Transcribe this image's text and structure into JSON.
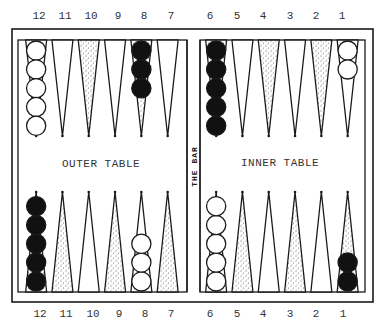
{
  "board": {
    "title": "Backgammon board diagram",
    "top_numbers": [
      "12",
      "11",
      "10",
      "9",
      "8",
      "7",
      "6",
      "5",
      "4",
      "3",
      "2",
      "1"
    ],
    "bottom_numbers": [
      "12",
      "11",
      "10",
      "9",
      "8",
      "7",
      "6",
      "5",
      "4",
      "3",
      "2",
      "1"
    ],
    "outer_table_label": "OUTER TABLE",
    "inner_table_label": "INNER TABLE",
    "bar_label": "THE BAR",
    "top_points": [
      {
        "point": "12",
        "shade": "plain",
        "checkers": {
          "color": "white",
          "count": 5
        }
      },
      {
        "point": "11",
        "shade": "plain",
        "checkers": {
          "color": "none",
          "count": 0
        }
      },
      {
        "point": "10",
        "shade": "stippled",
        "checkers": {
          "color": "none",
          "count": 0
        }
      },
      {
        "point": "9",
        "shade": "plain",
        "checkers": {
          "color": "none",
          "count": 0
        }
      },
      {
        "point": "8",
        "shade": "stippled",
        "checkers": {
          "color": "black",
          "count": 3
        }
      },
      {
        "point": "7",
        "shade": "plain",
        "checkers": {
          "color": "none",
          "count": 0
        }
      },
      {
        "point": "6",
        "shade": "stippled",
        "checkers": {
          "color": "black",
          "count": 5
        }
      },
      {
        "point": "5",
        "shade": "plain",
        "checkers": {
          "color": "none",
          "count": 0
        }
      },
      {
        "point": "4",
        "shade": "stippled",
        "checkers": {
          "color": "none",
          "count": 0
        }
      },
      {
        "point": "3",
        "shade": "plain",
        "checkers": {
          "color": "none",
          "count": 0
        }
      },
      {
        "point": "2",
        "shade": "stippled",
        "checkers": {
          "color": "none",
          "count": 0
        }
      },
      {
        "point": "1",
        "shade": "plain",
        "checkers": {
          "color": "white",
          "count": 2
        }
      }
    ],
    "bottom_points": [
      {
        "point": "12",
        "shade": "stippled",
        "checkers": {
          "color": "black",
          "count": 5
        }
      },
      {
        "point": "11",
        "shade": "stippled",
        "checkers": {
          "color": "none",
          "count": 0
        }
      },
      {
        "point": "10",
        "shade": "plain",
        "checkers": {
          "color": "none",
          "count": 0
        }
      },
      {
        "point": "9",
        "shade": "stippled",
        "checkers": {
          "color": "none",
          "count": 0
        }
      },
      {
        "point": "8",
        "shade": "plain",
        "checkers": {
          "color": "white",
          "count": 3
        }
      },
      {
        "point": "7",
        "shade": "stippled",
        "checkers": {
          "color": "none",
          "count": 0
        }
      },
      {
        "point": "6",
        "shade": "plain",
        "checkers": {
          "color": "white",
          "count": 5
        }
      },
      {
        "point": "5",
        "shade": "stippled",
        "checkers": {
          "color": "none",
          "count": 0
        }
      },
      {
        "point": "4",
        "shade": "plain",
        "checkers": {
          "color": "none",
          "count": 0
        }
      },
      {
        "point": "3",
        "shade": "stippled",
        "checkers": {
          "color": "none",
          "count": 0
        }
      },
      {
        "point": "2",
        "shade": "plain",
        "checkers": {
          "color": "none",
          "count": 0
        }
      },
      {
        "point": "1",
        "shade": "stippled",
        "checkers": {
          "color": "black",
          "count": 2
        }
      }
    ],
    "colors": {
      "line": "#1a1a1a",
      "background": "#ffffff",
      "black_checker": "#111111",
      "white_checker": "#ffffff",
      "stipple": "#555555"
    }
  }
}
